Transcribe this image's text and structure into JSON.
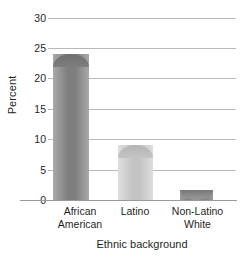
{
  "chart_data": {
    "type": "bar",
    "title": "",
    "subtitle": "",
    "xlabel": "Ethnic background",
    "ylabel": "Percent",
    "categories": [
      "African American",
      "Latino",
      "Non-Latino White"
    ],
    "category_lines": [
      [
        "African",
        "American"
      ],
      [
        "Latino"
      ],
      [
        "Non-Latino",
        "White"
      ]
    ],
    "values": [
      24,
      9,
      1.5
    ],
    "ylim": [
      0,
      30
    ],
    "yticks": [
      0,
      5,
      10,
      15,
      20,
      25,
      30
    ],
    "ytick_labels": [
      "0",
      "5",
      "10",
      "15",
      "20",
      "25",
      "30"
    ],
    "grid": true,
    "legend": "none",
    "bar_colors": [
      "#8c8c8c",
      "#c9c9c9",
      "#7e7e7e"
    ],
    "gridline_color": "#b9b9b9",
    "axis_color": "#9a9a9a",
    "background": "#ffffff"
  }
}
